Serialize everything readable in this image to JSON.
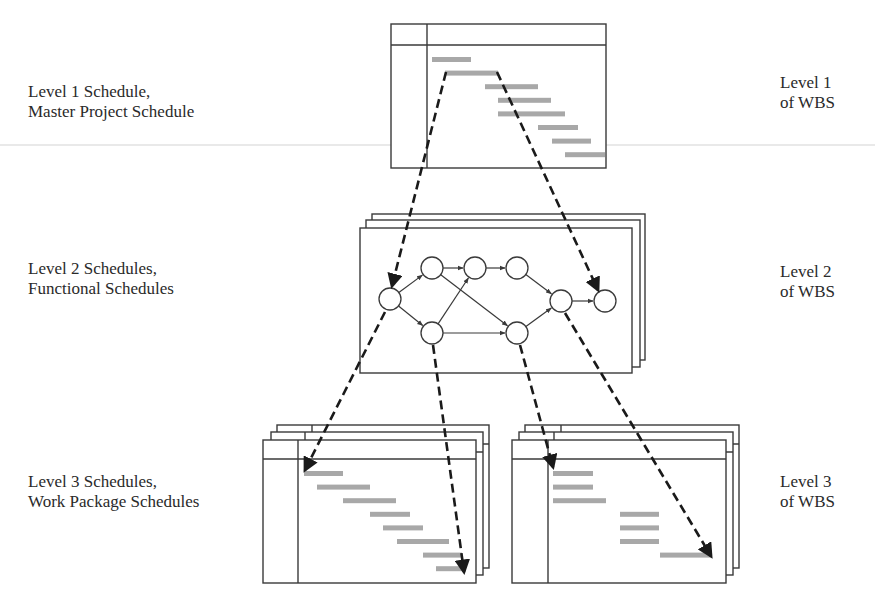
{
  "labels": {
    "left": [
      {
        "line1": "Level 1 Schedule,",
        "line2": "Master Project Schedule"
      },
      {
        "line1": "Level 2 Schedules,",
        "line2": "Functional Schedules"
      },
      {
        "line1": "Level 3 Schedules,",
        "line2": "Work Package Schedules"
      }
    ],
    "right": [
      {
        "line1": "Level 1",
        "line2": "of WBS"
      },
      {
        "line1": "Level 2",
        "line2": "of WBS"
      },
      {
        "line1": "Level 3",
        "line2": "of WBS"
      }
    ]
  },
  "colors": {
    "bar": "#a8a8a8",
    "line": "#3a3a3a",
    "arrow": "#1a1a1a"
  },
  "level1": {
    "type": "gantt",
    "bars": [
      [
        432,
        471
      ],
      [
        445,
        498
      ],
      [
        485,
        538
      ],
      [
        498,
        551
      ],
      [
        498,
        565
      ],
      [
        538,
        578
      ],
      [
        552,
        591
      ],
      [
        565,
        605
      ]
    ]
  },
  "level2": {
    "type": "network",
    "nodes": [
      {
        "id": "n1",
        "x": 390,
        "y": 299
      },
      {
        "id": "n2",
        "x": 432,
        "y": 268
      },
      {
        "id": "n3",
        "x": 475,
        "y": 268
      },
      {
        "id": "n4",
        "x": 517,
        "y": 268
      },
      {
        "id": "n5",
        "x": 432,
        "y": 333
      },
      {
        "id": "n6",
        "x": 517,
        "y": 333
      },
      {
        "id": "n7",
        "x": 561,
        "y": 301
      },
      {
        "id": "n8",
        "x": 605,
        "y": 301
      }
    ],
    "edges": [
      [
        "n1",
        "n2"
      ],
      [
        "n1",
        "n5"
      ],
      [
        "n2",
        "n3"
      ],
      [
        "n3",
        "n4"
      ],
      [
        "n2",
        "n6"
      ],
      [
        "n5",
        "n3"
      ],
      [
        "n5",
        "n6"
      ],
      [
        "n4",
        "n7"
      ],
      [
        "n6",
        "n7"
      ],
      [
        "n7",
        "n8"
      ]
    ]
  },
  "level3_left": {
    "type": "gantt",
    "bars": [
      [
        304,
        343
      ],
      [
        317,
        370
      ],
      [
        343,
        396
      ],
      [
        370,
        410
      ],
      [
        383,
        423
      ],
      [
        397,
        449
      ],
      [
        423,
        462
      ],
      [
        436,
        465
      ]
    ]
  },
  "level3_right": {
    "type": "gantt",
    "bars": [
      [
        553,
        593
      ],
      [
        553,
        593
      ],
      [
        553,
        606
      ],
      [
        620,
        659
      ],
      [
        620,
        659
      ],
      [
        620,
        659
      ],
      [
        660,
        712
      ]
    ]
  }
}
